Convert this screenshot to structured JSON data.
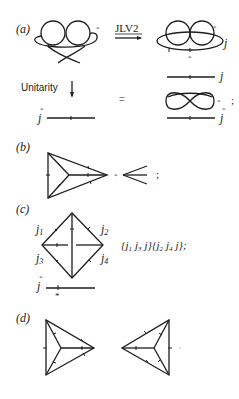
{
  "figure": {
    "panels": [
      {
        "label": "(a)",
        "arrow_label": "JLV2",
        "down_arrow_label": "Unitarity",
        "equals": "=",
        "semicolon": ";",
        "j_labels": [
          "j",
          "j",
          "j",
          "j"
        ],
        "star": "*"
      },
      {
        "label": "(b)",
        "semicolon": ";",
        "star": "*"
      },
      {
        "label": "(c)",
        "edge_labels": [
          "j1",
          "j2",
          "j3",
          "j4"
        ],
        "edge_labels_display": {
          "j1": "j",
          "j1_sub": "1",
          "j2": "j",
          "j2_sub": "2",
          "j3": "j",
          "j3_sub": "3",
          "j4": "j",
          "j4_sub": "4"
        },
        "formula": "{j1 j3 j}{j2 j4 j};",
        "formula_parts": {
          "open1": "{",
          "a": "j",
          "a_sub": "1",
          "b": "j",
          "b_sub": "3",
          "c": "j",
          "close1": "}",
          "open2": "{",
          "d": "j",
          "d_sub": "2",
          "e": "j",
          "e_sub": "4",
          "f": "j",
          "close2": "};"
        },
        "line_label": "j",
        "star": "*"
      },
      {
        "label": "(d)"
      }
    ]
  }
}
